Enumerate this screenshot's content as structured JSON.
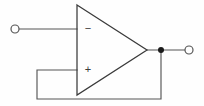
{
  "diagram": {
    "background_color": "#fefefe",
    "wire_color": "#555555",
    "outline_color": "#3a3a3a",
    "junction_color": "#1a1a1a",
    "canvas": {
      "width": 204,
      "height": 106
    }
  },
  "opamp": {
    "label": "",
    "shape": "triangle",
    "apex": {
      "x": 147,
      "y": 50
    },
    "top_left": {
      "x": 77,
      "y": 5
    },
    "bottom_left": {
      "x": 77,
      "y": 95
    },
    "inverting": {
      "symbol": "−",
      "name": "inverting-input",
      "symbol_x": 88,
      "symbol_y": 29,
      "pin_y": 29
    },
    "noninverting": {
      "symbol": "+",
      "name": "noninverting-input",
      "symbol_x": 88,
      "symbol_y": 70,
      "pin_y": 70
    }
  },
  "terminals": {
    "input": {
      "name": "input-terminal",
      "cx": 15,
      "cy": 29,
      "r": 4
    },
    "output": {
      "name": "output-terminal",
      "cx": 189,
      "cy": 50,
      "r": 4
    }
  },
  "junction": {
    "name": "output-node-junction",
    "cx": 161,
    "cy": 50,
    "r": 3
  },
  "wires": {
    "input_lead": "M19,29 L77,29",
    "output_lead": "M147,50 L185,50",
    "feedback": "M77,70 L37,70 L37,99 L161,99 L161,50"
  }
}
